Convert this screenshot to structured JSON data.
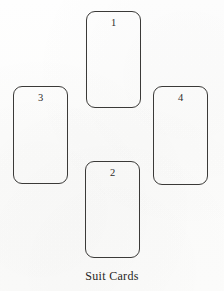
{
  "figure": {
    "caption": "Suit Cards",
    "background_color": "#fdfdfc",
    "stroke_color": "#3b3a38",
    "text_color": "#262523",
    "layout": "cross",
    "cards": [
      {
        "label": "1",
        "position": "top",
        "name": "card-1"
      },
      {
        "label": "2",
        "position": "bottom",
        "name": "card-2"
      },
      {
        "label": "3",
        "position": "left",
        "name": "card-3"
      },
      {
        "label": "4",
        "position": "right",
        "name": "card-4"
      }
    ]
  }
}
